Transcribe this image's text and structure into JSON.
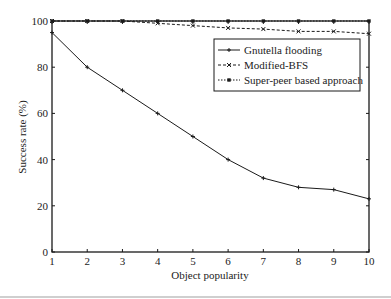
{
  "chart_data": {
    "type": "line",
    "title": "",
    "xlabel": "Object popularity",
    "ylabel": "Success rate (%)",
    "x": [
      1,
      2,
      3,
      4,
      5,
      6,
      7,
      8,
      9,
      10
    ],
    "xlim": [
      1,
      10
    ],
    "ylim": [
      0,
      100
    ],
    "xticks": [
      "1",
      "2",
      "3",
      "4",
      "5",
      "6",
      "7",
      "8",
      "9",
      "10"
    ],
    "yticks": [
      "0",
      "20",
      "40",
      "60",
      "80",
      "100"
    ],
    "grid": false,
    "legend_position": "upper right",
    "series": [
      {
        "name": "Gnutella flooding",
        "style": "solid",
        "marker": "plus",
        "values": [
          95,
          80,
          70,
          60,
          50,
          40,
          32,
          28,
          27,
          23
        ]
      },
      {
        "name": "Modified-BFS",
        "style": "dashed",
        "marker": "x",
        "values": [
          100,
          100,
          100,
          99,
          98,
          97,
          96.5,
          95.5,
          95.5,
          94.5
        ]
      },
      {
        "name": "Super-peer based approach",
        "style": "dotted",
        "marker": "square",
        "values": [
          100,
          100,
          100,
          100,
          100,
          100,
          100,
          100,
          100,
          100
        ]
      }
    ]
  },
  "colors": {
    "line": "#1a1a1a",
    "axis": "#1a1a1a",
    "background": "#ffffff"
  }
}
